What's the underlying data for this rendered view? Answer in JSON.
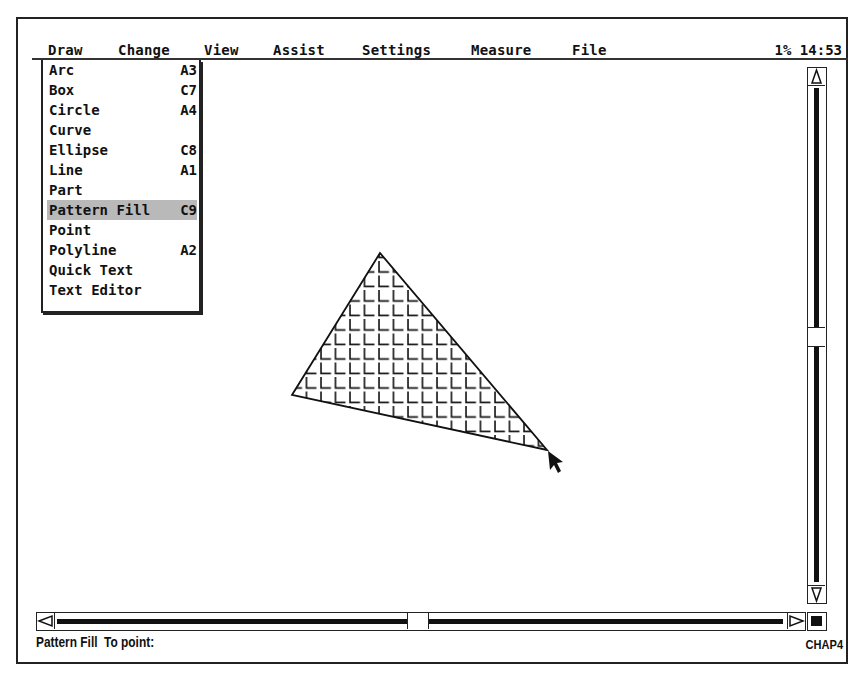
{
  "menubar": {
    "items": [
      {
        "label": "Draw"
      },
      {
        "label": "Change"
      },
      {
        "label": "View"
      },
      {
        "label": "Assist"
      },
      {
        "label": "Settings"
      },
      {
        "label": "Measure"
      },
      {
        "label": "File"
      }
    ],
    "status_indicator": "1% 14:53"
  },
  "draw_menu": {
    "items": [
      {
        "label": "Arc",
        "shortcut": "A3"
      },
      {
        "label": "Box",
        "shortcut": "C7"
      },
      {
        "label": "Circle",
        "shortcut": "A4"
      },
      {
        "label": "Curve",
        "shortcut": ""
      },
      {
        "label": "Ellipse",
        "shortcut": "C8"
      },
      {
        "label": "Line",
        "shortcut": "A1"
      },
      {
        "label": "Part",
        "shortcut": ""
      },
      {
        "label": "Pattern Fill",
        "shortcut": "C9",
        "highlighted": true
      },
      {
        "label": "Point",
        "shortcut": ""
      },
      {
        "label": "Polyline",
        "shortcut": "A2"
      },
      {
        "label": "Quick Text",
        "shortcut": ""
      },
      {
        "label": "Text Editor",
        "shortcut": ""
      }
    ]
  },
  "canvas": {
    "shape": "triangle",
    "fill": "grid-pattern",
    "vertices": [
      [
        380,
        253
      ],
      [
        292,
        395
      ],
      [
        547,
        450
      ]
    ],
    "cursor": "arrow-pointer"
  },
  "statusbar": {
    "command": "Pattern Fill",
    "prompt": "To point:",
    "document": "CHAP4"
  },
  "colors": {
    "background": "#ffffff",
    "ink": "#111111",
    "highlight": "#b9b9b9"
  }
}
